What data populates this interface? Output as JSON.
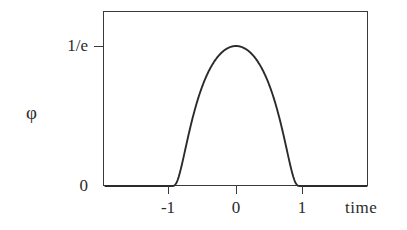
{
  "figure": {
    "kind": "mathematical-plot",
    "background_color": "#ffffff",
    "ink_color": "#2b2b2b",
    "frame_color": "#3a3a3a"
  },
  "axes": {
    "x_axis": {
      "label": "time",
      "tick_labels": [
        "-1",
        "0",
        "1"
      ],
      "tick_values": [
        -1,
        0,
        1
      ],
      "range": [
        -1.95,
        1.95
      ]
    },
    "y_axis": {
      "label": "φ",
      "tick_labels": [
        "1/e",
        "0"
      ],
      "tick_values": [
        0.3678794412,
        0
      ],
      "range": [
        0,
        0.445
      ]
    }
  },
  "chart_data": {
    "type": "line",
    "title": "",
    "subtitle": "",
    "xlabel": "time",
    "ylabel": "φ",
    "xlim": [
      -1.95,
      1.95
    ],
    "ylim": [
      0,
      0.445
    ],
    "grid": false,
    "legend": null,
    "xticks": [
      -1,
      0,
      1
    ],
    "xticklabels": [
      "-1",
      "0",
      "1"
    ],
    "yticks": [
      0,
      0.3678794412
    ],
    "yticklabels": [
      "0",
      "1/e"
    ],
    "annotations": [],
    "series": [
      {
        "name": "φ(t)",
        "formula": "exp(-1/(1-t^2)) for |t| < 1, 0 otherwise",
        "peak_value": 0.3678794412,
        "peak_label": "1/e",
        "support": [
          -1,
          1
        ],
        "x": [
          -1.95,
          -1.6,
          -1.3,
          -1.1,
          -1.0,
          -0.95,
          -0.9,
          -0.85,
          -0.8,
          -0.75,
          -0.7,
          -0.65,
          -0.6,
          -0.55,
          -0.5,
          -0.45,
          -0.4,
          -0.35,
          -0.3,
          -0.25,
          -0.2,
          -0.15,
          -0.1,
          -0.05,
          0.0,
          0.05,
          0.1,
          0.15,
          0.2,
          0.25,
          0.3,
          0.35,
          0.4,
          0.45,
          0.5,
          0.55,
          0.6,
          0.65,
          0.7,
          0.75,
          0.8,
          0.85,
          0.9,
          0.95,
          1.0,
          1.1,
          1.3,
          1.6,
          1.95
        ],
        "y": [
          0.0,
          0.0,
          0.0,
          0.0,
          0.0,
          2e-05,
          0.00512,
          0.0263,
          0.06217,
          0.1054,
          0.14957,
          0.19136,
          0.22933,
          0.26298,
          0.29229,
          0.31747,
          0.33885,
          0.35678,
          0.37163,
          0.38369,
          0.39324,
          0.40048,
          0.40558,
          0.40864,
          0.40967,
          0.40864,
          0.40558,
          0.40048,
          0.39324,
          0.38369,
          0.37163,
          0.35678,
          0.33885,
          0.31747,
          0.29229,
          0.26298,
          0.22933,
          0.19136,
          0.14957,
          0.1054,
          0.06217,
          0.0263,
          0.00512,
          2e-05,
          0.0,
          0.0,
          0.0,
          0.0,
          0.0
        ]
      }
    ]
  },
  "labels": {
    "y_tick_top": "1/e",
    "y_tick_bottom": "0",
    "y_axis_name": "φ",
    "x_tick_left": "-1",
    "x_tick_center": "0",
    "x_tick_right": "1",
    "x_axis_name": "time"
  }
}
